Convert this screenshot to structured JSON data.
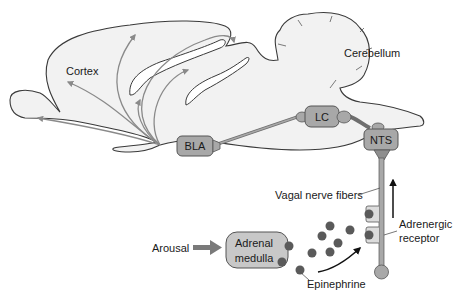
{
  "diagram": {
    "type": "neuroanatomy-pathway",
    "colors": {
      "brain_fill": "#f2f2f2",
      "brain_outline": "#3a3a3a",
      "brain_shadow": "#d4d4d4",
      "node_fill": "#a8a8a8",
      "node_outline": "#555555",
      "fiber": "#8c8c8c",
      "arrow_gray": "#8a8a8a",
      "dot_fill": "#5a5a5a",
      "black_arrow": "#111111",
      "adrenal_fill": "#c8c8c8"
    },
    "labels": {
      "cortex": "Cortex",
      "cerebellum": "Cerebellum",
      "bla": "BLA",
      "lc": "LC",
      "nts": "NTS",
      "vagal": "Vagal nerve fibers",
      "adrenergic_line1": "Adrenergic",
      "adrenergic_line2": "receptor",
      "arousal": "Arousal",
      "adrenal_line1": "Adrenal",
      "adrenal_line2": "medulla",
      "epinephrine": "Epinephrine"
    },
    "nodes": [
      {
        "id": "BLA",
        "label": "BLA",
        "region": "basolateral amygdala"
      },
      {
        "id": "LC",
        "label": "LC",
        "region": "locus coeruleus"
      },
      {
        "id": "NTS",
        "label": "NTS",
        "region": "nucleus of the solitary tract"
      },
      {
        "id": "AM",
        "label": "Adrenal medulla"
      }
    ],
    "edges": [
      {
        "from": "Arousal",
        "to": "Adrenal medulla"
      },
      {
        "from": "Adrenal medulla",
        "to": "Epinephrine"
      },
      {
        "from": "Epinephrine",
        "to": "Adrenergic receptor"
      },
      {
        "from": "Vagal nerve fibers",
        "to": "NTS"
      },
      {
        "from": "NTS",
        "to": "LC"
      },
      {
        "from": "LC",
        "to": "BLA"
      },
      {
        "from": "BLA",
        "to": "Cortex"
      }
    ]
  }
}
